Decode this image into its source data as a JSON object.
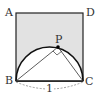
{
  "diagram": {
    "type": "geometry",
    "shape": "square ABCD with semicircle on BC",
    "labels": {
      "A": "A",
      "B": "B",
      "C": "C",
      "D": "D",
      "P": "P",
      "side_length": "1"
    },
    "colors": {
      "fill": "#e2e2e2",
      "stroke": "#222222",
      "semicircle_fill": "#ffffff"
    }
  }
}
